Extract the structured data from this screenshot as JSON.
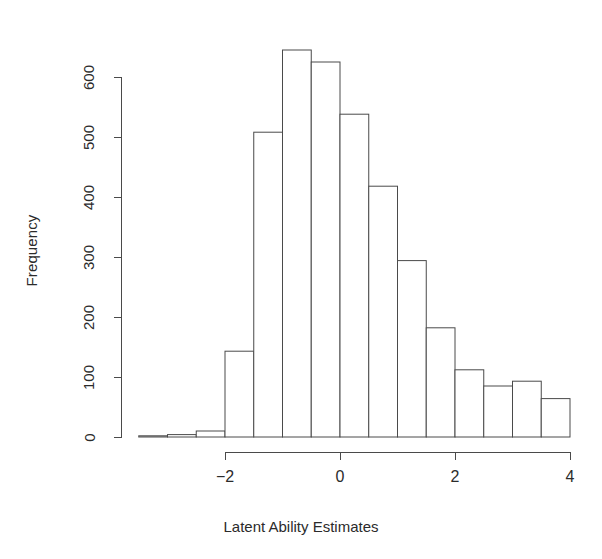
{
  "plot": {
    "title": "",
    "xlabel": "Latent Ability Estimates",
    "ylabel": "Frequency",
    "axis_color": "#4a4a4a",
    "bar_fill": "#ffffff",
    "bar_stroke": "#4a4a4a",
    "background": "#ffffff"
  },
  "axes": {
    "y_ticks": [
      "0",
      "100",
      "200",
      "300",
      "400",
      "500",
      "600"
    ],
    "x_ticks": [
      "−2",
      "0",
      "2",
      "4"
    ]
  },
  "chart_data": {
    "type": "bar",
    "title": "",
    "xlabel": "Latent Ability Estimates",
    "ylabel": "Frequency",
    "xlim": [
      -3.5,
      4.0
    ],
    "ylim": [
      0,
      650
    ],
    "xticks": [
      -2,
      0,
      2,
      4
    ],
    "yticks": [
      0,
      100,
      200,
      300,
      400,
      500,
      600
    ],
    "grid": false,
    "legend": false,
    "bin_width": 0.5,
    "bin_edges": [
      -3.5,
      -3.0,
      -2.5,
      -2.0,
      -1.5,
      -1.0,
      -0.5,
      0.0,
      0.5,
      1.0,
      1.5,
      2.0,
      2.5,
      3.0,
      3.5,
      4.0
    ],
    "bin_centers": [
      -3.25,
      -2.75,
      -2.25,
      -1.75,
      -1.25,
      -0.75,
      -0.25,
      0.25,
      0.75,
      1.25,
      1.75,
      2.25,
      2.75,
      3.25,
      3.75
    ],
    "values": [
      2,
      4,
      10,
      143,
      508,
      645,
      625,
      538,
      418,
      294,
      182,
      112,
      85,
      93,
      64
    ],
    "categories": [
      "-3.25",
      "-2.75",
      "-2.25",
      "-1.75",
      "-1.25",
      "-0.75",
      "-0.25",
      "0.25",
      "0.75",
      "1.25",
      "1.75",
      "2.25",
      "2.75",
      "3.25",
      "3.75"
    ]
  }
}
